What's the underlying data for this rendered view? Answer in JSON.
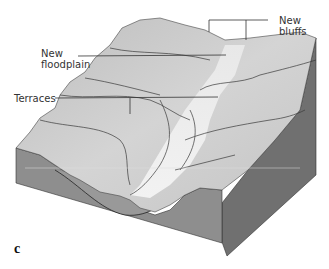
{
  "figure": {
    "panel_letter": "c",
    "labels": {
      "new_bluffs": "New bluffs",
      "new_floodplain_line1": "New",
      "new_floodplain_line2": "floodplain",
      "terraces": "Terraces"
    },
    "colors": {
      "surface": "#c8c8c8",
      "surface_light": "#e6e6e6",
      "front_face": "#8c8c8c",
      "side_face": "#6e6e6e",
      "leader_line": "#333333"
    }
  }
}
